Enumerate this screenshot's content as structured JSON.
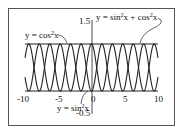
{
  "chart_data": {
    "type": "line",
    "title": "",
    "xlabel": "",
    "ylabel": "",
    "xlim": [
      -10,
      10
    ],
    "ylim": [
      -0.5,
      1.5
    ],
    "grid": false,
    "x_ticks": [
      "-10",
      "-5",
      "0",
      "5",
      "10"
    ],
    "y_ticks": [
      "1.5",
      "-0.5"
    ],
    "series": [
      {
        "name": "y = cos²x",
        "function": "cos(x)^2",
        "x_range": [
          -10,
          10
        ],
        "color": "#222222"
      },
      {
        "name": "y = sin²x",
        "function": "sin(x)^2",
        "x_range": [
          -10,
          10
        ],
        "color": "#222222"
      },
      {
        "name": "y = sin²x + cos²x",
        "function": "1",
        "x_range": [
          -10,
          10
        ],
        "color": "#222222"
      }
    ],
    "annotations": [
      {
        "text_parts": [
          "y = cos",
          "2",
          "x"
        ],
        "target": "cos²x curve"
      },
      {
        "text_parts": [
          "y = sin",
          "2",
          "x + cos",
          "2",
          "x"
        ],
        "target": "horizontal line y=1"
      },
      {
        "text_parts": [
          "y = sin",
          "2",
          "x"
        ],
        "target": "sin²x curve"
      }
    ]
  },
  "labels": {
    "tick_x_m10": "-10",
    "tick_x_m5": "-5",
    "tick_x_0": "0",
    "tick_x_5": "5",
    "tick_x_10": "10",
    "tick_y_top": "1.5",
    "tick_y_bottom": "-0.5",
    "cos_label_a": "y = cos",
    "cos_label_sup": "2",
    "cos_label_b": "x",
    "sum_label_a": "y = sin",
    "sum_label_sup1": "2",
    "sum_label_b": "x + cos",
    "sum_label_sup2": "2",
    "sum_label_c": "x",
    "sin_label_a": "y = sin",
    "sin_label_sup": "2",
    "sin_label_b": "x"
  }
}
